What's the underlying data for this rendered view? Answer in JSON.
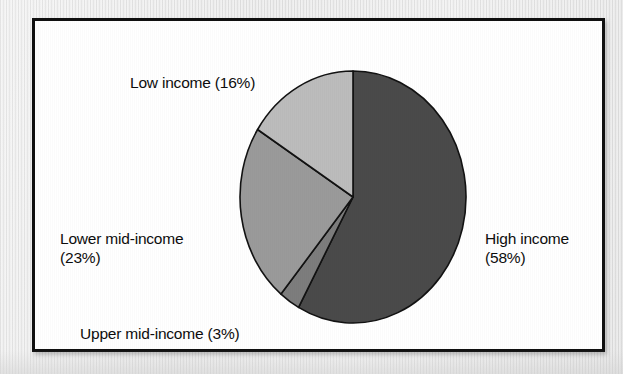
{
  "figure": {
    "background_color": "#ececec",
    "frame_color": "#101010",
    "plot_background": "#ffffff"
  },
  "chart_data": {
    "type": "pie",
    "title": "",
    "subtitle": "",
    "xlabel": "",
    "ylabel": "",
    "legend_position": "none",
    "grid": false,
    "units": "percent",
    "start_angle_deg": 0,
    "direction": "clockwise",
    "categories": [
      "High income",
      "Upper mid-income",
      "Lower mid-income",
      "Low income"
    ],
    "values": [
      58,
      3,
      23,
      16
    ],
    "slices": [
      {
        "name": "High income",
        "value": 58,
        "value_text": "58%",
        "label_text": "High income\n(58%)",
        "color": "#4a4a4a",
        "start_angle_deg": 0,
        "end_angle_deg": 208.8,
        "label_position": "right"
      },
      {
        "name": "Upper mid-income",
        "value": 3,
        "value_text": "3%",
        "label_text": "Upper mid-income (3%)",
        "color": "#7d7d7d",
        "start_angle_deg": 208.8,
        "end_angle_deg": 219.6,
        "label_position": "bottom-left"
      },
      {
        "name": "Lower mid-income",
        "value": 23,
        "value_text": "23%",
        "label_text": "Lower mid-income\n(23%)",
        "color": "#9a9a9a",
        "start_angle_deg": 219.6,
        "end_angle_deg": 302.4,
        "label_position": "left"
      },
      {
        "name": "Low income",
        "value": 16,
        "value_text": "16%",
        "label_text": "Low income (16%)",
        "color": "#bcbcbc",
        "start_angle_deg": 302.4,
        "end_angle_deg": 360,
        "label_position": "top-left"
      }
    ],
    "geometry": {
      "center_x": 318,
      "center_y": 176,
      "radius_x": 113,
      "radius_y": 126,
      "outline_color": "#121212",
      "outline_width": 1.6
    }
  }
}
